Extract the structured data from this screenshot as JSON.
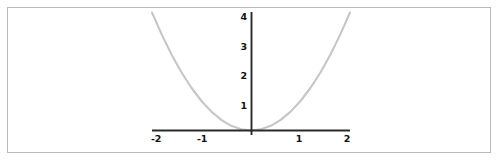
{
  "figure": {
    "background_color": "#ffffff",
    "border_color": "#b9b9b9",
    "axis_color": "#2a2a2a",
    "curve_color": "#c6c6c6"
  },
  "chart_data": {
    "type": "line",
    "title": "",
    "subtitle": "",
    "xlabel": "",
    "ylabel": "",
    "function": "y = x^2",
    "xlim": [
      -2.35,
      2.35
    ],
    "ylim": [
      -0.25,
      4.4
    ],
    "xticks": [
      -2,
      -1,
      1,
      2
    ],
    "yticks": [
      1,
      2,
      3,
      4
    ],
    "xtick_labels": [
      "-2",
      "-1",
      "1",
      "2"
    ],
    "ytick_labels": [
      "1",
      "2",
      "3",
      "4"
    ],
    "grid": false,
    "legend": false,
    "legend_position": "none",
    "series": [
      {
        "name": "y = x^2",
        "color": "#c6c6c6",
        "x": [
          -2.0,
          -1.8,
          -1.6,
          -1.4,
          -1.2,
          -1.0,
          -0.8,
          -0.6,
          -0.4,
          -0.2,
          0.0,
          0.2,
          0.4,
          0.6,
          0.8,
          1.0,
          1.2,
          1.4,
          1.6,
          1.8,
          2.0
        ],
        "y": [
          4.0,
          3.24,
          2.56,
          1.96,
          1.44,
          1.0,
          0.64,
          0.36,
          0.16,
          0.04,
          0.0,
          0.04,
          0.16,
          0.36,
          0.64,
          1.0,
          1.44,
          1.96,
          2.56,
          3.24,
          4.0
        ]
      }
    ],
    "annotations": []
  },
  "ticks": {
    "x": [
      {
        "label": "-2",
        "value": -2
      },
      {
        "label": "-1",
        "value": -1
      },
      {
        "label": "1",
        "value": 1
      },
      {
        "label": "2",
        "value": 2
      }
    ],
    "y": [
      {
        "label": "4",
        "value": 4
      },
      {
        "label": "3",
        "value": 3
      },
      {
        "label": "2",
        "value": 2
      },
      {
        "label": "1",
        "value": 1
      }
    ]
  }
}
